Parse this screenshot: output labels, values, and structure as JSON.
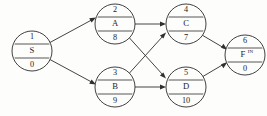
{
  "diagram": {
    "type": "activity-on-node-network",
    "background_color": "#fdfdfc",
    "line_color": "#2f2f2f",
    "nodes": [
      {
        "key": "n1",
        "id": "1",
        "name": "S",
        "duration": "0",
        "superscript": "",
        "cx": 32,
        "cy": 51,
        "r": 20
      },
      {
        "key": "n2",
        "id": "2",
        "name": "A",
        "duration": "8",
        "superscript": "",
        "cx": 115,
        "cy": 24,
        "r": 20
      },
      {
        "key": "n3",
        "id": "3",
        "name": "B",
        "duration": "9",
        "superscript": "",
        "cx": 115,
        "cy": 87,
        "r": 20
      },
      {
        "key": "n4",
        "id": "4",
        "name": "C",
        "duration": "7",
        "superscript": "",
        "cx": 186,
        "cy": 24,
        "r": 20
      },
      {
        "key": "n5",
        "id": "5",
        "name": "D",
        "duration": "10",
        "superscript": "",
        "cx": 186,
        "cy": 87,
        "r": 20
      },
      {
        "key": "n6",
        "id": "6",
        "name": "F",
        "duration": "0",
        "superscript": "IN",
        "cx": 245,
        "cy": 55,
        "r": 20
      }
    ],
    "edges": [
      {
        "key": "e1",
        "from": "1",
        "to": "2",
        "label": ""
      },
      {
        "key": "e2",
        "from": "1",
        "to": "3",
        "label": ""
      },
      {
        "key": "e3",
        "from": "2",
        "to": "4",
        "label": ""
      },
      {
        "key": "e4",
        "from": "2",
        "to": "5",
        "label": ""
      },
      {
        "key": "e5",
        "from": "3",
        "to": "4",
        "label": ""
      },
      {
        "key": "e6",
        "from": "3",
        "to": "5",
        "label": ""
      },
      {
        "key": "e7",
        "from": "4",
        "to": "6",
        "label": ""
      },
      {
        "key": "e8",
        "from": "5",
        "to": "6",
        "label": ""
      }
    ]
  }
}
